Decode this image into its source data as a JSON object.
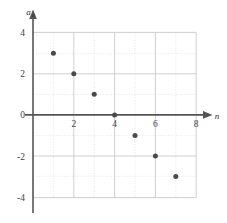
{
  "chart_data": {
    "type": "scatter",
    "title": "",
    "subtitle": "",
    "xlabel": "n",
    "ylabel": "a_n",
    "ylabel_base": "a",
    "ylabel_sub": "n",
    "x": [
      1,
      2,
      3,
      4,
      5,
      6,
      7
    ],
    "values": [
      3,
      2,
      1,
      0,
      -1,
      -2,
      -3
    ],
    "points": [
      {
        "n": 1,
        "a": 3
      },
      {
        "n": 2,
        "a": 2
      },
      {
        "n": 3,
        "a": 1
      },
      {
        "n": 4,
        "a": 0
      },
      {
        "n": 5,
        "a": -1
      },
      {
        "n": 6,
        "a": -2
      },
      {
        "n": 7,
        "a": -3
      }
    ],
    "xlim": [
      0,
      8
    ],
    "ylim": [
      -4,
      4
    ],
    "xticks": [
      2,
      4,
      6,
      8
    ],
    "xtick_labels": [
      "2",
      "4",
      "6",
      "8"
    ],
    "yticks": [
      4,
      2,
      0,
      -2,
      -4
    ],
    "ytick_labels": [
      "4",
      "2",
      "0",
      "-2",
      "-4"
    ],
    "grid": true,
    "grid_major_step": 2,
    "grid_minor_step": 1,
    "legend": false,
    "legend_position": "none",
    "marker": "filled-circle",
    "marker_color": "#4a4a4a",
    "marker_size": 5,
    "axis_color": "#555555",
    "grid_major_color": "#c9c9c9",
    "grid_minor_color": "#dcdcdc",
    "background_color": "#ffffff",
    "x_axis_arrow": true,
    "y_axis_arrow": true,
    "annotations": []
  },
  "axis_labels": {
    "x": "n",
    "y_base": "a",
    "y_sub": "n"
  },
  "ticks": {
    "x": [
      "2",
      "4",
      "6",
      "8"
    ],
    "y": [
      "4",
      "2",
      "0",
      "-2",
      "-4"
    ]
  }
}
